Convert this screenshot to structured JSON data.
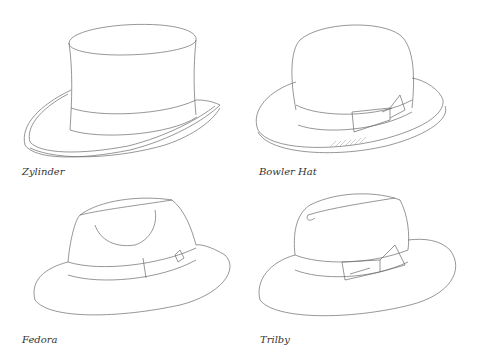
{
  "figure": {
    "hats": [
      {
        "id": "zylinder",
        "label": "Zylinder"
      },
      {
        "id": "bowler",
        "label": "Bowler Hat"
      },
      {
        "id": "fedora",
        "label": "Fedora"
      },
      {
        "id": "trilby",
        "label": "Trilby"
      }
    ],
    "colors": {
      "line": "#6a6a6a",
      "label": "#333333",
      "background": "#ffffff"
    }
  }
}
